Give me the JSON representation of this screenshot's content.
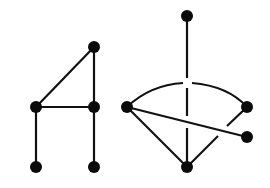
{
  "diagram": {
    "type": "graph-drawings",
    "colors": {
      "stroke": "#111111",
      "node": "#0a0a0a",
      "background": "#ffffff"
    },
    "graphs": [
      {
        "name": "left-graph",
        "nodes": [
          {
            "id": "a",
            "x": 94,
            "y": 47
          },
          {
            "id": "b",
            "x": 36,
            "y": 107
          },
          {
            "id": "c",
            "x": 94,
            "y": 107
          },
          {
            "id": "d",
            "x": 36,
            "y": 167
          },
          {
            "id": "e",
            "x": 94,
            "y": 167
          }
        ],
        "edges": [
          [
            "a",
            "b"
          ],
          [
            "a",
            "c"
          ],
          [
            "b",
            "c"
          ],
          [
            "b",
            "d"
          ],
          [
            "c",
            "e"
          ]
        ]
      },
      {
        "name": "right-graph",
        "nodes": [
          {
            "id": "f",
            "x": 187,
            "y": 16
          },
          {
            "id": "g",
            "x": 127,
            "y": 107
          },
          {
            "id": "h",
            "x": 247,
            "y": 107
          },
          {
            "id": "i",
            "x": 247,
            "y": 137
          },
          {
            "id": "j",
            "x": 187,
            "y": 167
          }
        ],
        "edges": [
          [
            "f",
            "j"
          ],
          [
            "g",
            "h",
            "arc"
          ],
          [
            "g",
            "i"
          ],
          [
            "g",
            "j"
          ],
          [
            "j",
            "h"
          ]
        ],
        "crossings": "drawn with gaps (over/under style)"
      }
    ]
  }
}
